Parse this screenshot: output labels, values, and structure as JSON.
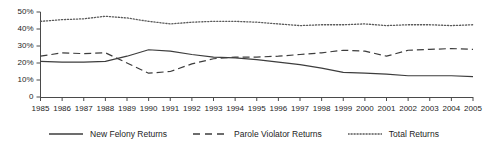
{
  "chart_data": {
    "type": "line",
    "title": "",
    "subtitle": "",
    "xlabel": "",
    "ylabel": "",
    "grid": false,
    "legend_position": "bottom",
    "x": [
      1985,
      1986,
      1987,
      1988,
      1989,
      1990,
      1991,
      1992,
      1993,
      1994,
      1995,
      1996,
      1997,
      1998,
      1999,
      2000,
      2001,
      2002,
      2003,
      2004,
      2005
    ],
    "xtick_labels": [
      "1985",
      "1986",
      "1987",
      "1988",
      "1989",
      "1990",
      "1991",
      "1992",
      "1993",
      "1994",
      "1995",
      "1996",
      "1997",
      "1998",
      "1999",
      "2000",
      "2001",
      "2002",
      "2003",
      "2004",
      "2005"
    ],
    "ylim": [
      0,
      50
    ],
    "ytick_values": [
      0,
      10,
      20,
      30,
      40,
      50
    ],
    "ytick_labels": [
      "0",
      "10%",
      "20%",
      "30%",
      "40%",
      "50%"
    ],
    "series": [
      {
        "name": "New Felony Returns",
        "style": "solid",
        "color": "#3d3d3d",
        "values": [
          21.0,
          20.5,
          20.5,
          21.0,
          24.0,
          27.8,
          27.0,
          25.0,
          23.5,
          23.0,
          22.0,
          20.5,
          19.0,
          17.0,
          14.5,
          14.0,
          13.5,
          12.5,
          12.5,
          12.5,
          12.0
        ]
      },
      {
        "name": "Parole Violator Returns",
        "style": "dashed",
        "color": "#3d3d3d",
        "values": [
          24.0,
          26.0,
          25.5,
          26.0,
          20.0,
          14.0,
          15.0,
          19.5,
          22.5,
          23.5,
          23.5,
          24.0,
          25.0,
          26.0,
          27.5,
          27.0,
          24.0,
          27.5,
          28.0,
          28.5,
          28.0
        ]
      },
      {
        "name": "Total Returns",
        "style": "dotted",
        "color": "#5a5a5a",
        "values": [
          44.5,
          45.5,
          46.0,
          47.5,
          46.5,
          44.5,
          43.0,
          44.0,
          44.5,
          44.5,
          44.0,
          43.0,
          42.0,
          42.5,
          42.5,
          43.0,
          42.0,
          42.5,
          42.5,
          42.0,
          42.5
        ]
      }
    ],
    "legend": [
      {
        "label": "New Felony Returns",
        "style": "solid"
      },
      {
        "label": "Parole Violator Returns",
        "style": "dashed"
      },
      {
        "label": "Total Returns",
        "style": "dotted"
      }
    ]
  }
}
